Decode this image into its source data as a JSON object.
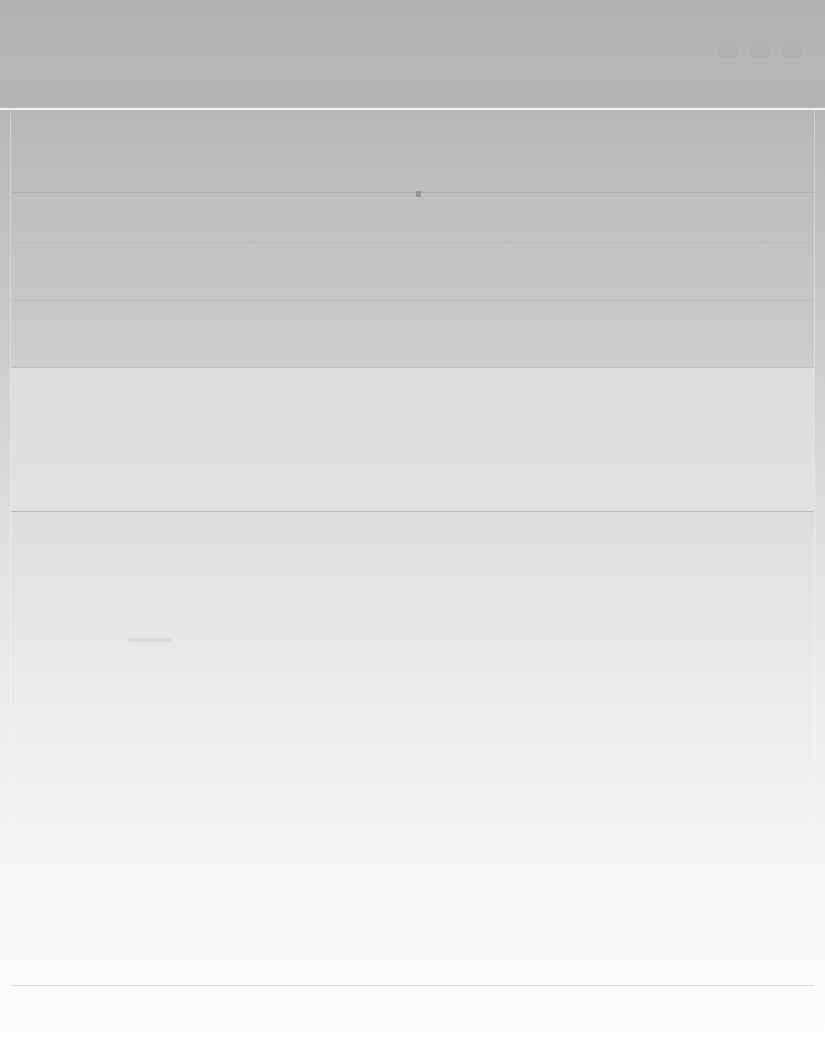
{
  "window": {
    "title": "",
    "subtitle": ""
  },
  "header": {
    "title": "",
    "subtitle": "",
    "icons": [
      "minimize-icon",
      "maximize-icon",
      "close-icon"
    ]
  },
  "list": {
    "rows": [
      {
        "label": "",
        "value": ""
      },
      {
        "label": "",
        "value": ""
      },
      {
        "label": "",
        "value": ""
      },
      {
        "label": "",
        "value": ""
      }
    ]
  },
  "section_card": {
    "title": "",
    "body": ""
  },
  "content": {
    "placeholder": ""
  },
  "footer": {
    "status": ""
  },
  "colors": {
    "header_band": "#b4b4b4",
    "header_separator": "#f4f4f4",
    "content_top": "#b8b8b8",
    "content_bottom": "#fbfbfb",
    "divider": "#9a9a9a",
    "panel_edge": "#ffffff",
    "footer_divider": "#cdcdcd",
    "pointer_marker": "#5a5a5f"
  },
  "notes": {
    "render_state": "blank",
    "legible_text": "none"
  }
}
